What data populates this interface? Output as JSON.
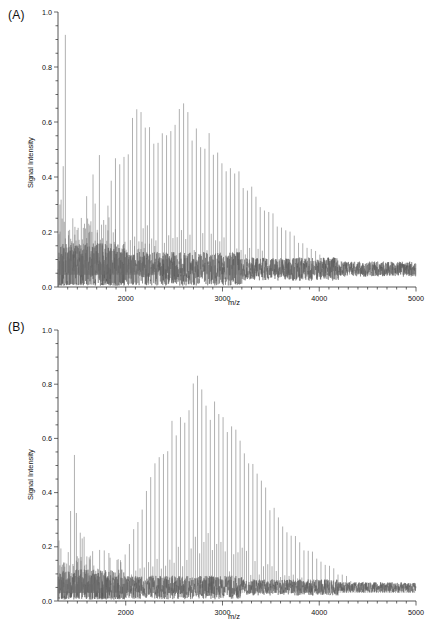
{
  "figure": {
    "type": "mass-spectrometry-figure",
    "panel_count": 2,
    "background": "#ffffff",
    "trace_color": "#6e6e6e"
  },
  "panels": [
    {
      "id": "A",
      "label": "(A)",
      "xlabel": "m/z",
      "ylabel": "Signal Intensity"
    },
    {
      "id": "B",
      "label": "(B)",
      "xlabel": "m/z",
      "ylabel": "Signal Intensity"
    }
  ],
  "axes": {
    "x_ticklabels": [
      "2000",
      "3000",
      "4000",
      "5000"
    ],
    "x_tickvalues": [
      2000,
      3000,
      4000,
      5000
    ],
    "x_minor_step": 100,
    "xlim": [
      1300,
      5000
    ],
    "y_ticklabels": [
      "0.0",
      "0.2",
      "0.4",
      "0.6",
      "0.8",
      "1.0"
    ],
    "y_tickvalues": [
      0.0,
      0.2,
      0.4,
      0.6,
      0.8,
      1.0
    ],
    "y_minor_step": 0.05,
    "ylim": [
      0.0,
      1.0
    ]
  },
  "chart_data": [
    {
      "type": "line",
      "panel": "A",
      "title": "",
      "xlabel": "m/z",
      "ylabel": "Signal Intensity",
      "xlim": [
        1300,
        5000
      ],
      "ylim": [
        0.0,
        1.0
      ],
      "grid": false,
      "legend": "none",
      "description": "MALDI mass spectrum: dense low-mass cluster saturating at 1.0 near 1350-1450, followed by a broad regularly-spaced polymer peak series peaking ~0.62 near m/z 2600, decaying into baseline noise ~0.06 beyond m/z 4200.",
      "peak_spacing": 44,
      "series": [
        {
          "name": "Spectrum A",
          "envelope": {
            "shape": "gaussian",
            "center": 2600,
            "sigma": 620,
            "amplitude": 0.56,
            "start": 1850
          },
          "low_mass_cluster": {
            "range": [
              1310,
              1820
            ],
            "max": 1.0,
            "spacing": 22,
            "density": "high"
          },
          "baseline": 0.065,
          "noise_amplitude": 0.05,
          "labeled_peaks": [
            {
              "mz": 1330,
              "intensity": 1.0
            },
            {
              "mz": 1360,
              "intensity": 1.0
            },
            {
              "mz": 1420,
              "intensity": 0.47
            },
            {
              "mz": 1480,
              "intensity": 0.45
            },
            {
              "mz": 1560,
              "intensity": 0.6
            },
            {
              "mz": 1660,
              "intensity": 0.85
            },
            {
              "mz": 1720,
              "intensity": 0.52
            },
            {
              "mz": 1820,
              "intensity": 0.4
            },
            {
              "mz": 2000,
              "intensity": 0.5
            },
            {
              "mz": 2140,
              "intensity": 0.66
            },
            {
              "mz": 2330,
              "intensity": 0.55
            },
            {
              "mz": 2480,
              "intensity": 0.58
            },
            {
              "mz": 2600,
              "intensity": 0.62
            },
            {
              "mz": 2720,
              "intensity": 0.57
            },
            {
              "mz": 2860,
              "intensity": 0.52
            },
            {
              "mz": 3000,
              "intensity": 0.46
            },
            {
              "mz": 3200,
              "intensity": 0.38
            },
            {
              "mz": 3400,
              "intensity": 0.3
            },
            {
              "mz": 3600,
              "intensity": 0.22
            },
            {
              "mz": 3800,
              "intensity": 0.16
            },
            {
              "mz": 4000,
              "intensity": 0.12
            },
            {
              "mz": 4300,
              "intensity": 0.08
            },
            {
              "mz": 4700,
              "intensity": 0.07
            }
          ]
        }
      ]
    },
    {
      "type": "line",
      "panel": "B",
      "title": "",
      "xlabel": "m/z",
      "ylabel": "Signal Intensity",
      "xlim": [
        1300,
        5000
      ],
      "ylim": [
        0.0,
        1.0
      ],
      "grid": false,
      "legend": "none",
      "description": "MALDI mass spectrum: sharp low-mass cluster topping 0.64 near m/z 1450, a quiet gap near m/z 1800-2000, then a clean regularly-spaced polymer distribution peaking at 0.78 near m/z 2750, tailing into baseline ~0.05 past m/z 4400.",
      "peak_spacing": 44,
      "series": [
        {
          "name": "Spectrum B",
          "envelope": {
            "shape": "gaussian",
            "center": 2750,
            "sigma": 560,
            "amplitude": 0.74,
            "start": 1950
          },
          "low_mass_cluster": {
            "range": [
              1310,
              1720
            ],
            "max": 0.64,
            "spacing": 20,
            "density": "high"
          },
          "baseline": 0.05,
          "noise_amplitude": 0.035,
          "labeled_peaks": [
            {
              "mz": 1340,
              "intensity": 0.3
            },
            {
              "mz": 1400,
              "intensity": 0.32
            },
            {
              "mz": 1450,
              "intensity": 0.64
            },
            {
              "mz": 1520,
              "intensity": 0.44
            },
            {
              "mz": 1600,
              "intensity": 0.26
            },
            {
              "mz": 1700,
              "intensity": 0.2
            },
            {
              "mz": 1900,
              "intensity": 0.12
            },
            {
              "mz": 2100,
              "intensity": 0.26
            },
            {
              "mz": 2250,
              "intensity": 0.42
            },
            {
              "mz": 2400,
              "intensity": 0.58
            },
            {
              "mz": 2550,
              "intensity": 0.7
            },
            {
              "mz": 2700,
              "intensity": 0.77
            },
            {
              "mz": 2780,
              "intensity": 0.78
            },
            {
              "mz": 2900,
              "intensity": 0.73
            },
            {
              "mz": 3050,
              "intensity": 0.64
            },
            {
              "mz": 3200,
              "intensity": 0.55
            },
            {
              "mz": 3400,
              "intensity": 0.42
            },
            {
              "mz": 3600,
              "intensity": 0.31
            },
            {
              "mz": 3800,
              "intensity": 0.22
            },
            {
              "mz": 4000,
              "intensity": 0.15
            },
            {
              "mz": 4200,
              "intensity": 0.1
            },
            {
              "mz": 4400,
              "intensity": 0.07
            },
            {
              "mz": 4800,
              "intensity": 0.05
            }
          ]
        }
      ]
    }
  ]
}
